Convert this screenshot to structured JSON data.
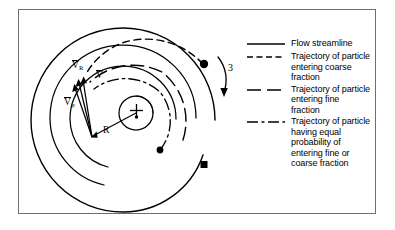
{
  "figure": {
    "frame_color": "#6e6e6e",
    "background": "#ffffff",
    "ink_color": "#000000"
  },
  "diagram": {
    "name": "centrifugal-classifier-spiral-flow",
    "center_marker": "+",
    "rotation_label": "3",
    "radius_label": "R",
    "vectors": [
      {
        "id": "v-resultant",
        "base": "V",
        "subscript": "",
        "overbar": true
      },
      {
        "id": "v-radial",
        "base": "V",
        "subscript": "R",
        "overbar": true
      },
      {
        "id": "v-tangential",
        "base": "V",
        "subscript": "φ",
        "overbar": true
      }
    ],
    "particle_markers": [
      {
        "id": "particle-top-right",
        "shape": "circle"
      },
      {
        "id": "particle-lower-center",
        "shape": "circle"
      },
      {
        "id": "particle-bottom-right",
        "shape": "square"
      }
    ]
  },
  "legend": {
    "items": [
      {
        "style": "solid",
        "label": "Flow streamline"
      },
      {
        "style": "dashed",
        "label": "Trajectory of particle entering coarse fraction"
      },
      {
        "style": "long-dash",
        "label": "Trajectory of particle entering fine fraction"
      },
      {
        "style": "dash-dot",
        "label": "Trajectory of particle having equal probability of entering fine or coarse fraction"
      }
    ]
  }
}
